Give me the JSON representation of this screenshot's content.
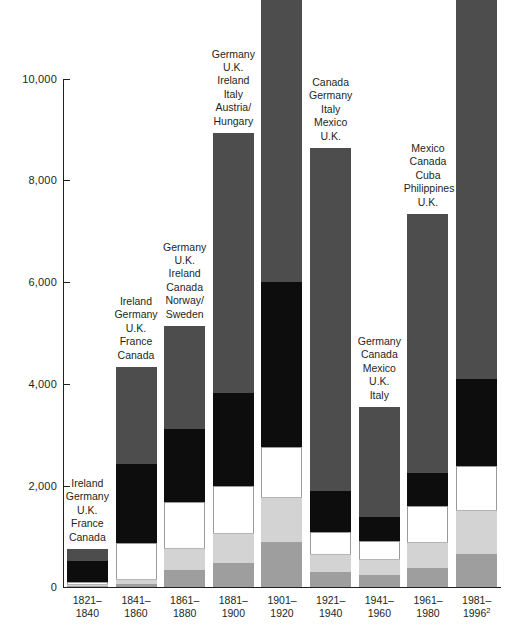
{
  "chart_data": {
    "type": "bar",
    "title": "",
    "subtitle": "",
    "xlabel": "",
    "ylabel": "",
    "stacked": true,
    "grid": false,
    "legend": "none",
    "ylim": [
      0,
      10000
    ],
    "yticks": [
      0,
      2000,
      4000,
      6000,
      8000,
      10000
    ],
    "ytick_labels": [
      "0",
      "2,000",
      "4,000",
      "6,000",
      "8,000",
      "10,000"
    ],
    "categories": [
      "1821–\n1840",
      "1841–\n1860",
      "1861–\n1880",
      "1881–\n1900",
      "1901–\n1920",
      "1921–\n1940",
      "1941–\n1960",
      "1961–\n1980",
      "1981–\n1996"
    ],
    "totals": [
      751,
      4312,
      5127,
      8935,
      14532,
      8636,
      3551,
      7338,
      13688
    ],
    "series": [
      {
        "name": "segment-1-bottom",
        "color": "#9e9e9e",
        "values": [
          20,
          60,
          330,
          470,
          880,
          300,
          240,
          370,
          640
        ]
      },
      {
        "name": "segment-2",
        "color": "#d3d3d3",
        "values": [
          30,
          90,
          430,
          600,
          880,
          350,
          320,
          520,
          860
        ]
      },
      {
        "name": "segment-3",
        "color": "#ffffff",
        "values": [
          45,
          700,
          900,
          920,
          980,
          430,
          350,
          700,
          860
        ]
      },
      {
        "name": "segment-4",
        "color": "#0d0d0d",
        "values": [
          420,
          1550,
          1440,
          1830,
          3240,
          800,
          480,
          640,
          1720
        ]
      },
      {
        "name": "segment-5-top",
        "color": "#4d4d4d",
        "values": [
          236,
          1912,
          2027,
          5115,
          8552,
          6756,
          2161,
          5108,
          9608
        ]
      }
    ],
    "bars": [
      {
        "period_line1": "1821–",
        "period_line2": "1840",
        "total": 751,
        "countries": [
          "Ireland",
          "Germany",
          "U.K.",
          "France",
          "Canada"
        ]
      },
      {
        "period_line1": "1841–",
        "period_line2": "1860",
        "total": 4312,
        "countries": [
          "Ireland",
          "Germany",
          "U.K.",
          "France",
          "Canada"
        ]
      },
      {
        "period_line1": "1861–",
        "period_line2": "1880",
        "total": 5127,
        "countries": [
          "Germany",
          "U.K.",
          "Ireland",
          "Canada",
          "Norway/",
          "Sweden"
        ]
      },
      {
        "period_line1": "1881–",
        "period_line2": "1900",
        "total": 8935,
        "countries": [
          "Germany",
          "U.K.",
          "Ireland",
          "Italy",
          "Austria/",
          "Hungary"
        ]
      },
      {
        "period_line1": "1901–",
        "period_line2": "1920",
        "total": 14532,
        "countries": [
          "Italy",
          "Austria/",
          "Hungary",
          "Soviet",
          "Union",
          "Canada",
          "U.K."
        ]
      },
      {
        "period_line1": "1921–",
        "period_line2": "1940",
        "total": 8636,
        "countries": [
          "Canada",
          "Germany",
          "Italy",
          "Mexico",
          "U.K."
        ]
      },
      {
        "period_line1": "1941–",
        "period_line2": "1960",
        "total": 3551,
        "countries": [
          "Germany",
          "Canada",
          "Mexico",
          "U.K.",
          "Italy"
        ]
      },
      {
        "period_line1": "1961–",
        "period_line2": "1980",
        "total": 7338,
        "countries": [
          "Mexico",
          "Canada",
          "Cuba",
          "Philippines",
          "U.K."
        ]
      },
      {
        "period_line1": "1981–",
        "period_line2": "1996",
        "period_line2_sup": "2",
        "total": 13688,
        "countries": [
          "Mexico",
          "Philippines",
          "China",
          "Dominican",
          "Republic",
          "India"
        ],
        "country_sup_index": 2,
        "country_sup": "1"
      }
    ]
  },
  "axis": {
    "y_labels": [
      "10,000",
      "8,000",
      "6,000",
      "4,000",
      "2,000",
      "0"
    ]
  }
}
